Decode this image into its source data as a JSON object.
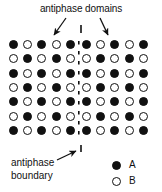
{
  "figure": {
    "title": "antiphase domains",
    "boundary_caption_line1": "antiphase",
    "boundary_caption_line2": "boundary",
    "ink_color": "#111111",
    "background_color": "#ffffff"
  },
  "legend": {
    "entries": [
      {
        "symbol": "filled-circle",
        "label": "A"
      },
      {
        "symbol": "open-circle",
        "label": "B"
      }
    ]
  },
  "annotations": [
    {
      "name": "left-domain-arrow",
      "points_to": "left antiphase domain",
      "direction": "down-left"
    },
    {
      "name": "right-domain-arrow",
      "points_to": "right antiphase domain",
      "direction": "down-right"
    },
    {
      "name": "boundary-arrow",
      "points_to": "antiphase boundary",
      "direction": "up-right"
    },
    {
      "name": "top-boundary-tick",
      "points_to": "antiphase boundary top end",
      "direction": "vertical-tick"
    },
    {
      "name": "bottom-boundary-tick",
      "points_to": "antiphase boundary bottom end",
      "direction": "vertical-tick"
    }
  ],
  "chart_data": {
    "type": "scatter",
    "title": "antiphase domains",
    "rows": 7,
    "columns": 10,
    "symbols": {
      "A": "filled-circle",
      "B": "open-circle"
    },
    "boundary": {
      "orientation": "vertical",
      "between_columns": [
        5,
        6
      ],
      "style": "dashed"
    },
    "grid": [
      [
        "A",
        "B",
        "A",
        "B",
        "A",
        "A",
        "B",
        "A",
        "B",
        "A"
      ],
      [
        "B",
        "A",
        "B",
        "A",
        "B",
        "B",
        "A",
        "B",
        "A",
        "B"
      ],
      [
        "A",
        "B",
        "A",
        "B",
        "A",
        "A",
        "B",
        "A",
        "B",
        "A"
      ],
      [
        "B",
        "A",
        "B",
        "A",
        "B",
        "B",
        "A",
        "B",
        "A",
        "B"
      ],
      [
        "A",
        "B",
        "A",
        "B",
        "A",
        "A",
        "B",
        "A",
        "B",
        "A"
      ],
      [
        "B",
        "A",
        "B",
        "A",
        "B",
        "B",
        "A",
        "B",
        "A",
        "B"
      ],
      [
        "A",
        "B",
        "A",
        "B",
        "A",
        "A",
        "B",
        "A",
        "B",
        "A"
      ]
    ],
    "legend": [
      "A",
      "B"
    ],
    "legend_position": "bottom-right"
  }
}
